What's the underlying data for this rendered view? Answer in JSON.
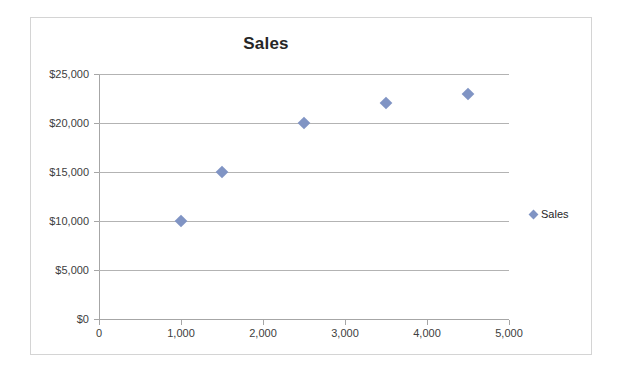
{
  "chart_data": {
    "type": "scatter",
    "title": "Sales",
    "xlabel": "",
    "ylabel": "",
    "xlim": [
      0,
      5000
    ],
    "ylim": [
      0,
      25000
    ],
    "grid": true,
    "legend_position": "right",
    "series": [
      {
        "name": "Sales",
        "marker": "diamond",
        "color": "#8094c4",
        "points": [
          {
            "x": 1000,
            "y": 10000
          },
          {
            "x": 1500,
            "y": 15000
          },
          {
            "x": 2500,
            "y": 20000
          },
          {
            "x": 3500,
            "y": 22000
          },
          {
            "x": 4500,
            "y": 23000
          }
        ]
      }
    ],
    "x_ticks": [
      {
        "value": 0,
        "label": "0"
      },
      {
        "value": 1000,
        "label": "1,000"
      },
      {
        "value": 2000,
        "label": "2,000"
      },
      {
        "value": 3000,
        "label": "3,000"
      },
      {
        "value": 4000,
        "label": "4,000"
      },
      {
        "value": 5000,
        "label": "5,000"
      }
    ],
    "y_ticks": [
      {
        "value": 0,
        "label": "$0"
      },
      {
        "value": 5000,
        "label": "$5,000"
      },
      {
        "value": 10000,
        "label": "$10,000"
      },
      {
        "value": 15000,
        "label": "$15,000"
      },
      {
        "value": 20000,
        "label": "$20,000"
      },
      {
        "value": 25000,
        "label": "$25,000"
      }
    ],
    "legend": [
      {
        "label": "Sales",
        "color": "#8094c4",
        "marker": "diamond"
      }
    ]
  },
  "colors": {
    "series": "#8094c4",
    "gridline": "#b3b3b3",
    "axis": "#a6a6a6",
    "border": "#d4d4d4",
    "title_text": "#262626",
    "tick_text": "#404040"
  }
}
